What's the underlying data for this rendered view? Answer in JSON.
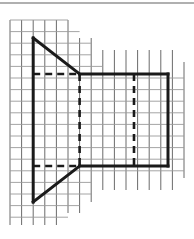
{
  "canvas": {
    "width": 194,
    "height": 239,
    "background": "#ffffff",
    "title": "Graph paper technical drawing"
  },
  "top_rule": {
    "name": "top-divider-rule",
    "x1": 0,
    "y1": 3,
    "x2": 194,
    "y2": 3,
    "color": "#b0b0b0",
    "width": 2
  },
  "grid": {
    "name": "graph-paper-grid",
    "color": "#5a5a5a",
    "light_color": "#9a9a9a",
    "line_width": 0.9,
    "spacing": 11.6,
    "origin_x": 10,
    "origin_y": 20,
    "columns": 16,
    "rows": 18,
    "vertical_lines_x": [
      10,
      21.6,
      33.2,
      44.8,
      56.4,
      68,
      79.6,
      91.2,
      102.8,
      114.4,
      126,
      137.6,
      149.2,
      160.8,
      172.4,
      184
    ],
    "vertical_top_y": [
      20,
      20,
      20,
      20,
      20,
      20,
      38,
      38,
      50,
      50,
      50,
      50,
      50,
      50,
      50,
      62
    ],
    "vertical_bottom_y": [
      225,
      225,
      225,
      225,
      225,
      213,
      213,
      202,
      190,
      190,
      190,
      190,
      190,
      190,
      190,
      178
    ],
    "horizontal_lines_y": [
      20,
      31.6,
      43.2,
      54.8,
      66.4,
      78,
      89.6,
      101.2,
      112.8,
      124.4,
      136,
      147.6,
      159.2,
      170.8,
      182.4,
      194,
      205.6,
      217.2
    ],
    "horizontal_left_x": [
      10,
      10,
      10,
      10,
      10,
      10,
      10,
      10,
      10,
      10,
      10,
      10,
      10,
      10,
      10,
      10,
      10,
      10
    ],
    "horizontal_right_x": [
      68,
      79.6,
      91.2,
      91.2,
      102.8,
      184,
      184,
      184,
      184,
      184,
      184,
      184,
      184,
      184,
      91.2,
      91.2,
      79.6,
      68
    ]
  },
  "figure": {
    "name": "frustum-side-view",
    "stroke_color": "#1a1a1a",
    "solid_width": 3.0,
    "dashed_width": 2.6,
    "dash_pattern": "7,5",
    "vertices": {
      "top_apex": {
        "label": "top-apex",
        "x": 33.2,
        "y": 38
      },
      "top_junction": {
        "label": "top-junction",
        "x": 79.6,
        "y": 74
      },
      "top_right": {
        "label": "top-right-corner",
        "x": 168,
        "y": 74
      },
      "bottom_right": {
        "label": "bottom-right-corner",
        "x": 168,
        "y": 166
      },
      "bottom_junction": {
        "label": "bottom-junction",
        "x": 79.6,
        "y": 166
      },
      "bottom_apex": {
        "label": "bottom-apex",
        "x": 33.2,
        "y": 202
      }
    },
    "solid_edges": [
      {
        "name": "left-vertical-edge",
        "x1": 33.2,
        "y1": 38,
        "x2": 33.2,
        "y2": 202
      },
      {
        "name": "upper-diagonal-edge",
        "x1": 33.2,
        "y1": 38,
        "x2": 79.6,
        "y2": 74
      },
      {
        "name": "lower-diagonal-edge",
        "x1": 33.2,
        "y1": 202,
        "x2": 79.6,
        "y2": 166
      },
      {
        "name": "top-horizontal-edge",
        "x1": 79.6,
        "y1": 74,
        "x2": 168,
        "y2": 74
      },
      {
        "name": "bottom-horizontal-edge",
        "x1": 79.6,
        "y1": 166,
        "x2": 168,
        "y2": 166
      },
      {
        "name": "right-vertical-edge",
        "x1": 168,
        "y1": 74,
        "x2": 168,
        "y2": 166
      }
    ],
    "dashed_edges": [
      {
        "name": "hidden-top-horizontal",
        "x1": 33.2,
        "y1": 74,
        "x2": 79.6,
        "y2": 74
      },
      {
        "name": "hidden-bottom-horizontal",
        "x1": 33.2,
        "y1": 166,
        "x2": 79.6,
        "y2": 166
      },
      {
        "name": "hidden-near-vertical",
        "x1": 79.6,
        "y1": 74,
        "x2": 79.6,
        "y2": 166
      },
      {
        "name": "hidden-far-vertical",
        "x1": 134,
        "y1": 74,
        "x2": 134,
        "y2": 166
      }
    ]
  }
}
